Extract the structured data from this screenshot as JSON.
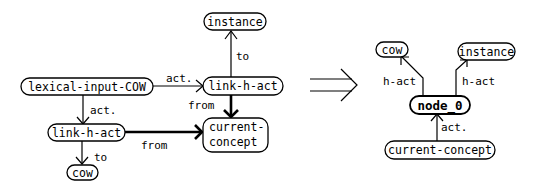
{
  "diagram": {
    "left": {
      "nodes": {
        "instance": "instance",
        "link_h_act_top": "link-h-act",
        "lexical_input": "lexical-input-COW",
        "link_h_act_low": "link-h-act",
        "current_concept_line1": "current-",
        "current_concept_line2": "concept",
        "cow": "cow"
      },
      "edges": {
        "lexical_to_link_top": "act.",
        "lexical_to_link_low": "act.",
        "link_top_to_instance": "to",
        "link_top_to_current": "from",
        "link_low_to_current": "from",
        "link_low_to_cow": "to"
      }
    },
    "transform_arrow": "double-right-arrow",
    "right": {
      "nodes": {
        "cow": "cow",
        "instance": "instance",
        "node_0": "node_0",
        "current_concept": "current-concept"
      },
      "edges": {
        "node_to_cow": "h-act",
        "node_to_instance": "h-act",
        "current_to_node": "act."
      }
    }
  }
}
